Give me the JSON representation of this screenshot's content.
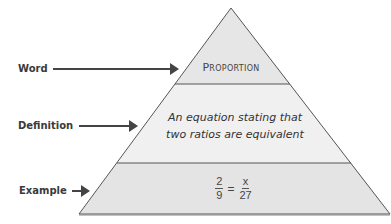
{
  "diagram": {
    "type": "vocabulary-pyramid",
    "labels": {
      "word": "Word",
      "definition": "Definition",
      "example": "Example"
    },
    "tiers": {
      "word": "Proportion",
      "definition_line1": "An equation stating that",
      "definition_line2": "two ratios are equivalent",
      "example": {
        "left_numerator": "2",
        "left_denominator": "9",
        "equals": "=",
        "right_numerator": "x",
        "right_denominator": "27"
      }
    },
    "icons": {
      "arrow": "right-arrow-icon"
    },
    "colors": {
      "outline": "#555555",
      "arrow": "#444444",
      "tier_top_fill": "#e6e6e6",
      "tier_middle_fill": "#f0f0f0",
      "tier_bottom_fill": "#e4e4e4",
      "label_text": "#3a3a3a"
    }
  }
}
